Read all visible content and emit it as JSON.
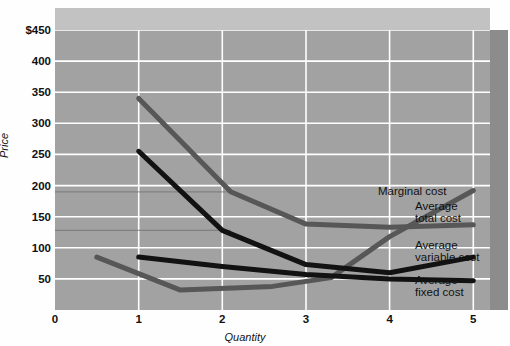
{
  "chart_data": {
    "type": "line",
    "title": "",
    "xlabel": "Quantity",
    "ylabel": "Price",
    "xlim": [
      0,
      5.2
    ],
    "ylim": [
      0,
      450
    ],
    "grid": true,
    "legend_position": "inline-right",
    "xticks": [
      "0",
      "1",
      "2",
      "3",
      "4",
      "5"
    ],
    "xtick_values": [
      0,
      1,
      2,
      3,
      4,
      5
    ],
    "yticks": [
      "$450",
      "400",
      "350",
      "300",
      "250",
      "200",
      "150",
      "100",
      "50"
    ],
    "ytick_values": [
      450,
      400,
      350,
      300,
      250,
      200,
      150,
      100,
      50
    ],
    "series": [
      {
        "name": "Marginal cost",
        "color": "#575757",
        "x": [
          0.5,
          1.5,
          2.6,
          3.3,
          4.0,
          5.0
        ],
        "values": [
          85,
          32,
          38,
          52,
          118,
          192
        ]
      },
      {
        "name": "Average total cost",
        "color": "#575757",
        "x": [
          1.0,
          2.1,
          3.0,
          4.0,
          5.0
        ],
        "values": [
          340,
          190,
          138,
          133,
          137
        ]
      },
      {
        "name": "Average variable cost",
        "color": "#121212",
        "x": [
          1.0,
          2.0,
          3.0,
          4.0,
          5.0
        ],
        "values": [
          255,
          128,
          73,
          60,
          85
        ]
      },
      {
        "name": "Average fixed cost",
        "color": "#121212",
        "x": [
          1.0,
          2.0,
          3.0,
          4.0,
          5.0
        ],
        "values": [
          85,
          70,
          57,
          50,
          47
        ]
      }
    ]
  },
  "labels": {
    "marginal_cost": "Marginal cost",
    "average_total_cost": "Average\ntotal cost",
    "average_variable_cost": "Average\nvariable cost",
    "average_fixed_cost": "Average\nfixed cost"
  },
  "colors": {
    "plot_background": "#a2a2a2",
    "wall_top": "#c2c2c2",
    "wall_right": "#8c8c8c",
    "gridline": "#ffffff",
    "dark_series": "#575757",
    "black_series": "#121212"
  }
}
